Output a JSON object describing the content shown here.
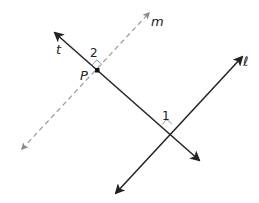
{
  "diagram": {
    "title": "",
    "lines": {
      "t": {
        "label": "t",
        "style": "solid",
        "color": "#222222",
        "start": [
          55,
          33
        ],
        "end": [
          199,
          160
        ],
        "arrows": "both"
      },
      "l": {
        "label": "ℓ",
        "style": "solid",
        "color": "#222222",
        "start": [
          242,
          57
        ],
        "end": [
          116,
          193
        ],
        "arrows": "both"
      },
      "m": {
        "label": "m",
        "style": "dashed",
        "color": "#999999",
        "start": [
          149,
          13
        ],
        "end": [
          22,
          149
        ],
        "arrows": "both"
      }
    },
    "points": {
      "P": {
        "label": "P",
        "position": [
          97,
          70
        ]
      }
    },
    "angles": {
      "angle1": {
        "label": "1",
        "vertex": [
          167,
          129
        ],
        "mark": "angle-arc"
      },
      "angle2": {
        "label": "2",
        "vertex": [
          97,
          70
        ],
        "mark": "right-angle"
      }
    },
    "labels": {
      "t": "t",
      "m": "m",
      "l": "ℓ",
      "P": "P",
      "angle1": "1",
      "angle2": "2"
    }
  }
}
